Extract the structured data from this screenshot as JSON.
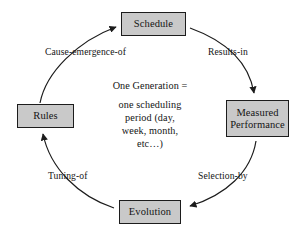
{
  "diagram": {
    "background_color": "#ffffff",
    "node_fill_color": "#c9c9c9",
    "node_border_color": "#1c1c1c",
    "arc_color": "#1c1c1c",
    "text_color": "#141414",
    "nodes": [
      {
        "id": "schedule",
        "label": "Schedule",
        "position": "top"
      },
      {
        "id": "measured-performance",
        "label": "Measured\nPerformance",
        "position": "right"
      },
      {
        "id": "evolution",
        "label": "Evolution",
        "position": "bottom"
      },
      {
        "id": "rules",
        "label": "Rules",
        "position": "left"
      }
    ],
    "edges": [
      {
        "id": "schedule-to-measured-performance",
        "label": "Results-in",
        "from": "schedule",
        "to": "measured-performance",
        "arrow": "down"
      },
      {
        "id": "measured-performance-to-evolution",
        "label": "Selection-by",
        "from": "measured-performance",
        "to": "evolution",
        "arrow": "left"
      },
      {
        "id": "evolution-to-rules",
        "label": "Tuning-of",
        "from": "evolution",
        "to": "rules",
        "arrow": "up"
      },
      {
        "id": "rules-to-schedule",
        "label": "Cause-emergence-of",
        "from": "rules",
        "to": "schedule",
        "arrow": "right"
      }
    ],
    "center_note": {
      "heading": "One Generation =",
      "body": "one scheduling\nperiod (day,\nweek, month,\netc…)"
    }
  }
}
